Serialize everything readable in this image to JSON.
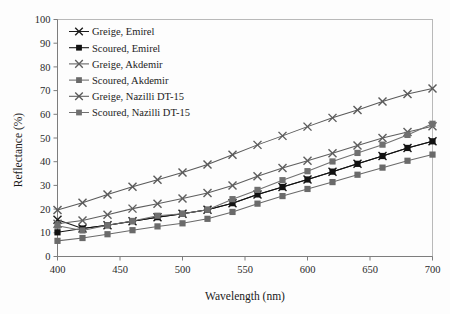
{
  "chart_data": {
    "type": "line",
    "title": "",
    "xlabel": "Wavelength (nm)",
    "ylabel": "Reflectance (%)",
    "xlim": [
      400,
      700
    ],
    "ylim": [
      0,
      100
    ],
    "xticks": [
      400,
      450,
      500,
      550,
      600,
      650,
      700
    ],
    "yticks": [
      0,
      10,
      20,
      30,
      40,
      50,
      60,
      70,
      80,
      90,
      100
    ],
    "grid": false,
    "legend_position": "upper-left",
    "x": [
      400,
      420,
      440,
      460,
      480,
      500,
      520,
      540,
      560,
      580,
      600,
      620,
      640,
      660,
      680,
      700
    ],
    "series": [
      {
        "name": "Greige, Emirel",
        "marker": "x",
        "color": "#1a1a1a",
        "values": [
          15.5,
          11.8,
          13.2,
          14.9,
          16.6,
          18.0,
          19.7,
          22.5,
          26.2,
          29.3,
          32.5,
          35.8,
          39.1,
          42.4,
          45.8,
          48.6
        ]
      },
      {
        "name": "Scoured, Emirel",
        "marker": "square",
        "color": "#111111",
        "values": [
          10.2,
          11.8,
          13.2,
          14.9,
          16.6,
          18.0,
          19.7,
          22.5,
          26.2,
          29.3,
          32.5,
          35.8,
          39.1,
          42.4,
          45.8,
          48.6
        ]
      },
      {
        "name": "Greige, Akdemir",
        "marker": "x",
        "color": "#5e5e5e",
        "values": [
          13.8,
          15.2,
          17.6,
          20.2,
          22.3,
          24.5,
          26.8,
          30.0,
          33.9,
          37.3,
          40.4,
          43.6,
          46.8,
          50.0,
          52.5,
          55.0
        ]
      },
      {
        "name": "Scoured, Akdemir",
        "marker": "square",
        "color": "#6a6a6a",
        "values": [
          6.6,
          7.8,
          9.4,
          11.1,
          12.7,
          14.0,
          15.9,
          18.8,
          22.3,
          25.5,
          28.5,
          31.4,
          34.5,
          37.5,
          40.4,
          43.0
        ]
      },
      {
        "name": "Greige, Nazilli DT-15",
        "marker": "x",
        "color": "#5a5a5a",
        "values": [
          19.6,
          22.7,
          26.2,
          29.4,
          32.4,
          35.4,
          38.8,
          42.9,
          47.1,
          50.9,
          54.8,
          58.5,
          61.8,
          65.4,
          68.6,
          70.9
        ]
      },
      {
        "name": "Scoured, Nazilli DT-15",
        "marker": "square",
        "color": "#707070",
        "values": [
          13.0,
          11.0,
          13.2,
          15.0,
          17.2,
          18.0,
          19.7,
          24.2,
          28.1,
          32.2,
          36.0,
          40.1,
          43.7,
          47.2,
          51.3,
          56.0
        ]
      }
    ],
    "legend_entries": [
      "Greige, Emirel",
      "Scoured, Emirel",
      "Greige, Akdemir",
      "Scoured, Akdemir",
      "Greige, Nazilli DT-15",
      "Scoured, Nazilli DT-15"
    ]
  },
  "axis": {
    "x_tick_labels": [
      "400",
      "450",
      "500",
      "550",
      "600",
      "650",
      "700"
    ],
    "y_tick_labels": [
      "0",
      "10",
      "20",
      "30",
      "40",
      "50",
      "60",
      "70",
      "80",
      "90",
      "100"
    ],
    "x_title": "Wavelength (nm)",
    "y_title": "Reflectance (%)"
  },
  "colors": {
    "frame": "#b9b9b9",
    "axis": "#7d7d7d",
    "background": "#fdfdfd",
    "dark_series": "#141414",
    "gray_series": "#666666"
  }
}
